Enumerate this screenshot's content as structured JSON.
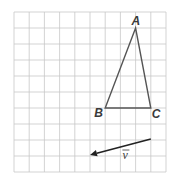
{
  "diagram": {
    "grid": {
      "columns": 10,
      "rows": 10
    },
    "triangle": {
      "vertices": [
        {
          "name": "A",
          "col": 8,
          "row": 1
        },
        {
          "name": "B",
          "col": 6,
          "row": 6
        },
        {
          "name": "C",
          "col": 9,
          "row": 6
        }
      ],
      "stroke": "#555555"
    },
    "vector": {
      "label": "v",
      "from": {
        "col": 9,
        "row": 8
      },
      "to": {
        "col": 5,
        "row": 9
      },
      "stroke": "#222222"
    },
    "colors": {
      "grid": "#c8c8c8",
      "background": "#ffffff"
    }
  }
}
